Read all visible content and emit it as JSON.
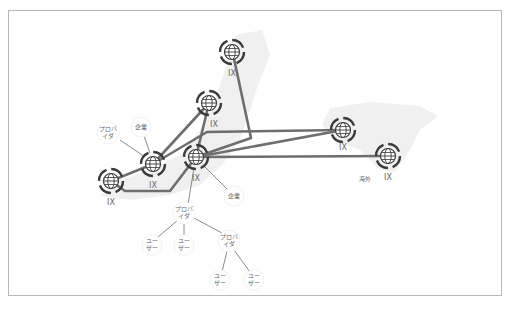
{
  "diagram": {
    "colors": {
      "link": "#6e6e6e",
      "thin_link": "#8a8a8a",
      "node_ring": "#3a3a3a",
      "text": "#666666",
      "map": "#eeeeee"
    },
    "ix_nodes": [
      {
        "id": "ix_top",
        "label": "IX",
        "x": 232,
        "y": 52
      },
      {
        "id": "ix_mid",
        "label": "IX",
        "x": 209,
        "y": 103
      },
      {
        "id": "ix_right",
        "label": "IX",
        "x": 343,
        "y": 130
      },
      {
        "id": "ix_far",
        "label": "IX",
        "x": 388,
        "y": 156,
        "note": "海外"
      },
      {
        "id": "ix_center",
        "label": "IX",
        "x": 196,
        "y": 157
      },
      {
        "id": "ix_left",
        "label": "IX",
        "x": 153,
        "y": 164
      },
      {
        "id": "ix_edge",
        "label": "IX",
        "x": 111,
        "y": 181
      }
    ],
    "entities": [
      {
        "id": "corp1",
        "label": "企業",
        "x": 141,
        "y": 127
      },
      {
        "id": "prov1",
        "label": "プロバ\nイダ",
        "x": 108,
        "y": 133
      },
      {
        "id": "corp2",
        "label": "企業",
        "x": 234,
        "y": 196
      },
      {
        "id": "prov2",
        "label": "プロバ\nイダ",
        "x": 184,
        "y": 213
      },
      {
        "id": "user1",
        "label": "ユー\nザー",
        "x": 152,
        "y": 245
      },
      {
        "id": "user2",
        "label": "ユー\nザー",
        "x": 184,
        "y": 245
      },
      {
        "id": "prov3",
        "label": "プロバ\nイダ",
        "x": 229,
        "y": 241
      },
      {
        "id": "user3",
        "label": "ユー\nザー",
        "x": 220,
        "y": 280
      },
      {
        "id": "user4",
        "label": "ユー\nザー",
        "x": 254,
        "y": 280
      }
    ],
    "overseas_label": "海外"
  }
}
